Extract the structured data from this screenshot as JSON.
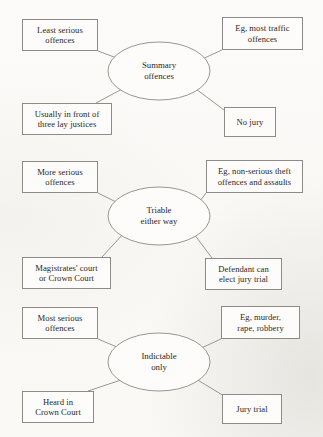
{
  "document": {
    "kind": "spider-diagram-set",
    "background_color": "#fbfaf8",
    "line_color": "#8d8b86",
    "text_color": "#2b2926"
  },
  "diagrams": [
    {
      "id": "summary-offences",
      "hub": {
        "label": "Summary\noffences",
        "cx": 159,
        "cy": 71,
        "rx": 51,
        "ry": 29
      },
      "branches": [
        {
          "name": "least-serious-offences",
          "label": "Least serious\noffences",
          "box": {
            "x": 22,
            "y": 19,
            "w": 76,
            "h": 32
          },
          "edge": {
            "x1": 98,
            "y1": 51,
            "x2": 122,
            "y2": 60
          }
        },
        {
          "name": "eg-most-traffic-offences",
          "label": "Eg, most traffic\noffences",
          "box": {
            "x": 222,
            "y": 17,
            "w": 81,
            "h": 33
          },
          "edge": {
            "x1": 222,
            "y1": 50,
            "x2": 200,
            "y2": 60
          }
        },
        {
          "name": "usually-in-front-of-three-lay-justices",
          "label": "Usually in front of\nthree lay justices",
          "box": {
            "x": 22,
            "y": 103,
            "w": 90,
            "h": 32
          },
          "edge": {
            "x1": 96,
            "y1": 103,
            "x2": 124,
            "y2": 88
          }
        },
        {
          "name": "no-jury",
          "label": "No jury",
          "box": {
            "x": 224,
            "y": 107,
            "w": 52,
            "h": 30
          },
          "edge": {
            "x1": 224,
            "y1": 110,
            "x2": 196,
            "y2": 89
          }
        }
      ]
    },
    {
      "id": "triable-either-way",
      "hub": {
        "label": "Triable\neither way",
        "cx": 159,
        "cy": 216,
        "rx": 51,
        "ry": 29
      },
      "branches": [
        {
          "name": "more-serious-offences",
          "label": "More serious\noffences",
          "box": {
            "x": 22,
            "y": 161,
            "w": 76,
            "h": 32
          },
          "edge": {
            "x1": 98,
            "y1": 193,
            "x2": 122,
            "y2": 205
          }
        },
        {
          "name": "eg-non-serious-theft-offences-and-assaults",
          "label": "Eg, non-serious theft\noffences and assaults",
          "box": {
            "x": 206,
            "y": 160,
            "w": 97,
            "h": 33
          },
          "edge": {
            "x1": 206,
            "y1": 193,
            "x2": 198,
            "y2": 204
          }
        },
        {
          "name": "magistrates-court-or-crown-court",
          "label": "Magistrates' court\nor Crown Court",
          "box": {
            "x": 22,
            "y": 257,
            "w": 89,
            "h": 32
          },
          "edge": {
            "x1": 102,
            "y1": 257,
            "x2": 124,
            "y2": 233
          }
        },
        {
          "name": "defendant-can-elect-jury-trial",
          "label": "Defendant can\nelect jury trial",
          "box": {
            "x": 205,
            "y": 258,
            "w": 77,
            "h": 32
          },
          "edge": {
            "x1": 212,
            "y1": 258,
            "x2": 194,
            "y2": 234
          }
        }
      ]
    },
    {
      "id": "indictable-only",
      "hub": {
        "label": "Indictable\nonly",
        "cx": 159,
        "cy": 362,
        "rx": 51,
        "ry": 29
      },
      "branches": [
        {
          "name": "most-serious-offences",
          "label": "Most serious\noffences",
          "box": {
            "x": 22,
            "y": 307,
            "w": 76,
            "h": 32
          },
          "edge": {
            "x1": 98,
            "y1": 339,
            "x2": 124,
            "y2": 350
          }
        },
        {
          "name": "eg-murder-rape-robbery",
          "label": "Eg, murder,\nrape, robbery",
          "box": {
            "x": 221,
            "y": 306,
            "w": 79,
            "h": 33
          },
          "edge": {
            "x1": 221,
            "y1": 339,
            "x2": 197,
            "y2": 350
          }
        },
        {
          "name": "heard-in-crown-court",
          "label": "Heard in\nCrown Court",
          "box": {
            "x": 22,
            "y": 391,
            "w": 72,
            "h": 32
          },
          "edge": {
            "x1": 88,
            "y1": 391,
            "x2": 124,
            "y2": 379
          }
        },
        {
          "name": "jury-trial",
          "label": "Jury trial",
          "box": {
            "x": 222,
            "y": 394,
            "w": 60,
            "h": 30
          },
          "edge": {
            "x1": 224,
            "y1": 396,
            "x2": 196,
            "y2": 379
          }
        }
      ]
    }
  ]
}
